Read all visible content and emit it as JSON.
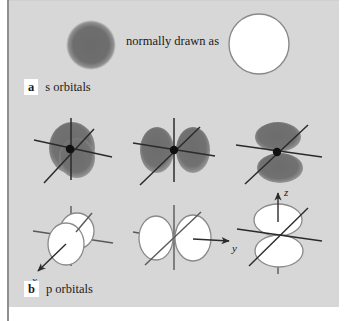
{
  "figure": {
    "background_color": "#d7d7d7",
    "page_color": "#ffffff",
    "orbital_fill_dark": "#6e6e6e",
    "orbital_fill_light": "#ffffff",
    "outline_color": "#8a8a8a",
    "axis_color": "#2b2b2b",
    "nucleus_color": "#101010"
  },
  "annotation": {
    "normally_drawn_as": "normally drawn as"
  },
  "panels": [
    {
      "letter": "a",
      "title": "s orbitals",
      "items": [
        {
          "name": "s-orbital-shaded",
          "style": "shaded-sphere"
        },
        {
          "name": "s-orbital-outline",
          "style": "outline-circle"
        }
      ]
    },
    {
      "letter": "b",
      "title": "p orbitals",
      "items": [
        {
          "name": "px-orbital-shaded",
          "style": "shaded",
          "axis": "x",
          "orientation": "front-back"
        },
        {
          "name": "py-orbital-shaded",
          "style": "shaded",
          "axis": "y",
          "orientation": "left-right"
        },
        {
          "name": "pz-orbital-shaded",
          "style": "shaded",
          "axis": "z",
          "orientation": "up-down"
        },
        {
          "name": "px-orbital-outline",
          "style": "outline",
          "axis": "x",
          "orientation": "front-back",
          "axis_label": "x"
        },
        {
          "name": "py-orbital-outline",
          "style": "outline",
          "axis": "y",
          "orientation": "left-right",
          "axis_label": "y"
        },
        {
          "name": "pz-orbital-outline",
          "style": "outline",
          "axis": "z",
          "orientation": "up-down",
          "axis_label": "z"
        }
      ]
    }
  ],
  "axis_labels": {
    "x": "x",
    "y": "y",
    "z": "z"
  }
}
